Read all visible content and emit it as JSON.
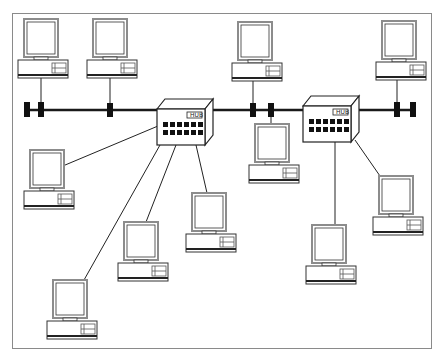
{
  "diagram": {
    "title": "",
    "type": "network-topology",
    "colors": {
      "line": "#1a1a1a",
      "monitor_frame": "#8c8c8c",
      "fill": "#ffffff",
      "port": "#111111"
    },
    "hubs": [
      {
        "id": "hub1",
        "label": "HUB",
        "x": 157,
        "y": 99,
        "ports": 12
      },
      {
        "id": "hub2",
        "label": "HUB",
        "x": 303,
        "y": 96,
        "ports": 12
      }
    ],
    "bus": {
      "y": 110,
      "x_start": 24,
      "x_end": 416
    },
    "terminators": [
      {
        "x": 27
      },
      {
        "x": 41
      },
      {
        "x": 110
      },
      {
        "x": 253
      },
      {
        "x": 271
      },
      {
        "x": 397
      },
      {
        "x": 413
      }
    ],
    "computers": [
      {
        "id": "pc1",
        "x": 20,
        "y": 19,
        "link": "bus"
      },
      {
        "id": "pc2",
        "x": 86,
        "y": 19,
        "link": "bus"
      },
      {
        "id": "pc3",
        "x": 234,
        "y": 22,
        "link": "bus"
      },
      {
        "id": "pc4",
        "x": 370,
        "y": 21,
        "link": "bus"
      },
      {
        "id": "pc5",
        "x": 253,
        "y": 124,
        "link": "bus"
      },
      {
        "id": "pc6",
        "x": 20,
        "y": 150,
        "link": "hub1"
      },
      {
        "id": "pc7",
        "x": 183,
        "y": 193,
        "link": "hub1"
      },
      {
        "id": "pc8",
        "x": 115,
        "y": 222,
        "link": "hub1"
      },
      {
        "id": "pc9",
        "x": 43,
        "y": 280,
        "link": "hub1"
      },
      {
        "id": "pc10",
        "x": 369,
        "y": 176,
        "link": "hub2"
      },
      {
        "id": "pc11",
        "x": 303,
        "y": 225,
        "link": "hub2"
      }
    ]
  }
}
